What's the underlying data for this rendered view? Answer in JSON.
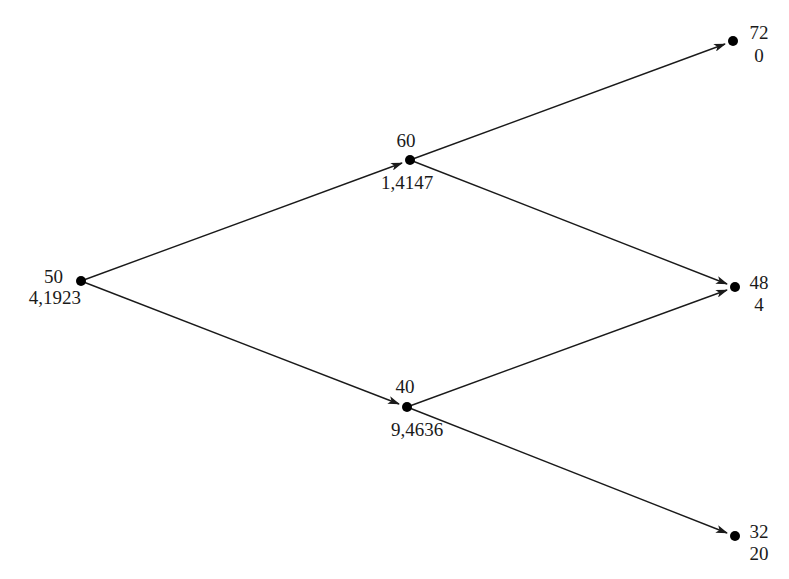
{
  "diagram": {
    "type": "binomial-tree",
    "nodes": [
      {
        "id": "root",
        "price": "50",
        "value": "4,1923",
        "x": 81,
        "y": 281
      },
      {
        "id": "up",
        "price": "60",
        "value": "1,4147",
        "x": 410,
        "y": 160
      },
      {
        "id": "down",
        "price": "40",
        "value": "9,4636",
        "x": 407,
        "y": 407
      },
      {
        "id": "upup",
        "price": "72",
        "value": "0",
        "x": 733,
        "y": 41
      },
      {
        "id": "updown",
        "price": "48",
        "value": "4",
        "x": 735,
        "y": 287
      },
      {
        "id": "downdown",
        "price": "32",
        "value": "20",
        "x": 735,
        "y": 536
      }
    ],
    "edges": [
      {
        "from": "root",
        "to": "up"
      },
      {
        "from": "root",
        "to": "down"
      },
      {
        "from": "up",
        "to": "upup"
      },
      {
        "from": "up",
        "to": "updown"
      },
      {
        "from": "down",
        "to": "updown"
      },
      {
        "from": "down",
        "to": "downdown"
      }
    ],
    "colors": {
      "line": "#1a1a1a",
      "node": "#000000",
      "background": "#ffffff"
    }
  }
}
